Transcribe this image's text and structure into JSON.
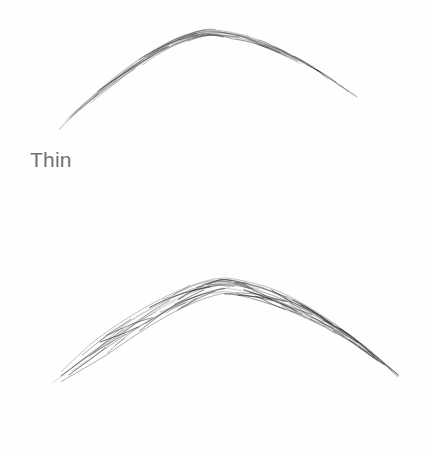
{
  "page": {
    "background_color": "#fefefe",
    "label_color": "#6f7073",
    "hair_color": "#3a3a3c"
  },
  "figures": [
    {
      "id": "thin",
      "label": "Thin",
      "description": "thin-arched-eyebrow-sketch",
      "thickness": "thin",
      "arch": "soft-high-arch",
      "hair_count": 54,
      "band_height_px": 7,
      "stroke_width": 0.55,
      "opacity": 0.82,
      "spine": {
        "start": [
          58,
          128
        ],
        "control1": [
          112,
          80
        ],
        "control2": [
          176,
          30
        ],
        "peak": [
          215,
          33
        ],
        "control3": [
          268,
          38
        ],
        "control4": [
          320,
          70
        ],
        "end": [
          358,
          98
        ]
      }
    },
    {
      "id": "medium",
      "label": "Medium",
      "description": "medium-thickness-arched-eyebrow-sketch",
      "thickness": "medium",
      "arch": "soft-rounded-arch",
      "hair_count": 86,
      "band_height_px": 18,
      "stroke_width": 0.7,
      "opacity": 0.88,
      "spine": {
        "start": [
          44,
          140
        ],
        "control1": [
          100,
          98
        ],
        "control2": [
          168,
          46
        ],
        "peak": [
          222,
          36
        ],
        "control3": [
          280,
          40
        ],
        "control4": [
          344,
          78
        ],
        "end": [
          400,
          128
        ]
      }
    }
  ]
}
